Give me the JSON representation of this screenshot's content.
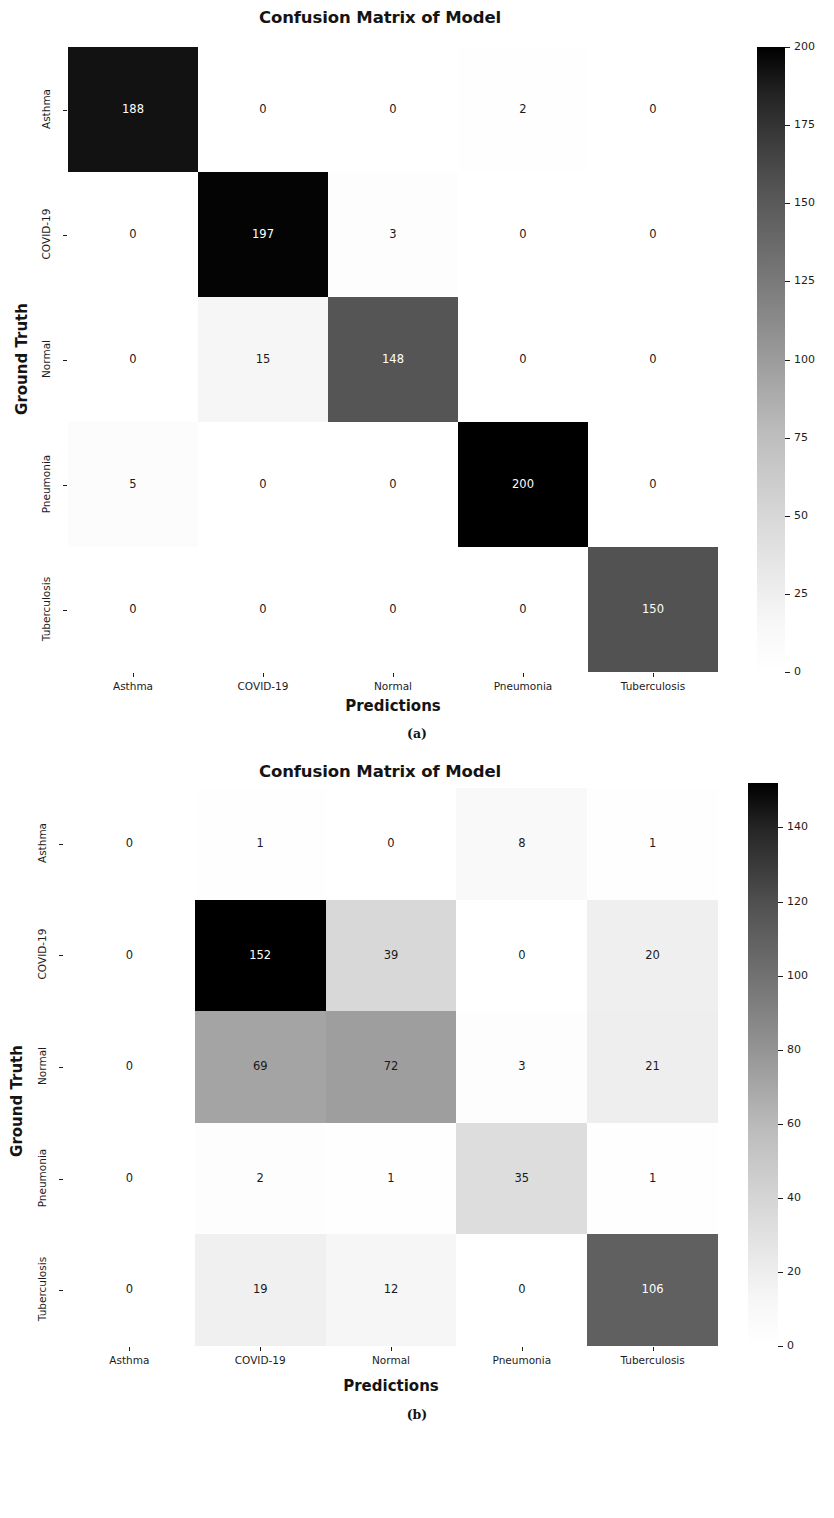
{
  "figures": [
    {
      "id": "a",
      "caption": "(a)",
      "title": "Confusion Matrix of Model",
      "chart_data": {
        "type": "heatmap",
        "title": "Confusion Matrix of Model",
        "xlabel": "Predictions",
        "ylabel": "Ground Truth",
        "categories": [
          "Asthma",
          "COVID-19",
          "Normal",
          "Pneumonia",
          "Tuberculosis"
        ],
        "row_labels": [
          "Asthma",
          "COVID-19",
          "Normal",
          "Pneumonia",
          "Tuberculosis"
        ],
        "col_labels": [
          "Asthma",
          "COVID-19",
          "Normal",
          "Pneumonia",
          "Tuberculosis"
        ],
        "values": [
          [
            188,
            0,
            0,
            2,
            0
          ],
          [
            0,
            197,
            3,
            0,
            0
          ],
          [
            0,
            15,
            148,
            0,
            0
          ],
          [
            5,
            0,
            0,
            200,
            0
          ],
          [
            0,
            0,
            0,
            0,
            150
          ]
        ],
        "colorbar": {
          "vmin": 0,
          "vmax": 200,
          "ticks": [
            0,
            25,
            50,
            75,
            100,
            125,
            150,
            175,
            200
          ],
          "tick_labels": [
            "0",
            "25",
            "50",
            "75",
            "100",
            "125",
            "150",
            "175",
            "200"
          ],
          "cmap": "Greys"
        },
        "grid": false,
        "legend": "colorbar-right"
      }
    },
    {
      "id": "b",
      "caption": "(b)",
      "title": "Confusion Matrix of Model",
      "chart_data": {
        "type": "heatmap",
        "title": "Confusion Matrix of Model",
        "xlabel": "Predictions",
        "ylabel": "Ground Truth",
        "categories": [
          "Asthma",
          "COVID-19",
          "Normal",
          "Pneumonia",
          "Tuberculosis"
        ],
        "row_labels": [
          "Asthma",
          "COVID-19",
          "Normal",
          "Pneumonia",
          "Tuberculosis"
        ],
        "col_labels": [
          "Asthma",
          "COVID-19",
          "Normal",
          "Pneumonia",
          "Tuberculosis"
        ],
        "values": [
          [
            0,
            1,
            0,
            8,
            1
          ],
          [
            0,
            152,
            39,
            0,
            20
          ],
          [
            0,
            69,
            72,
            3,
            21
          ],
          [
            0,
            2,
            1,
            35,
            1
          ],
          [
            0,
            19,
            12,
            0,
            106
          ]
        ],
        "colorbar": {
          "vmin": 0,
          "vmax": 152,
          "ticks": [
            0,
            20,
            40,
            60,
            80,
            100,
            120,
            140
          ],
          "tick_labels": [
            "0",
            "20",
            "40",
            "60",
            "80",
            "100",
            "120",
            "140"
          ],
          "cmap": "Greys"
        },
        "grid": false,
        "legend": "colorbar-right"
      }
    }
  ]
}
